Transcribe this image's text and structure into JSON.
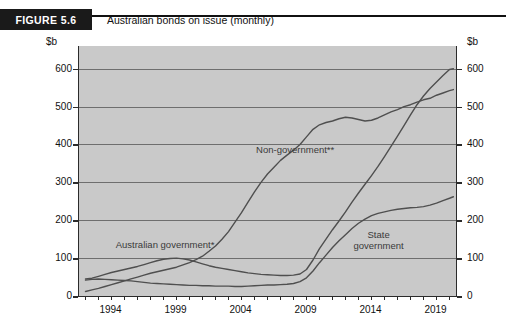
{
  "figure": {
    "tag": "FIGURE 5.6",
    "title": "Australian bonds on issue (monthly)"
  },
  "chart_data": {
    "type": "line",
    "title": "Australian bonds on issue (monthly)",
    "xlabel": "",
    "ylabel": "$b",
    "unit_label_left": "$b",
    "unit_label_right": "$b",
    "xlim": [
      1991.5,
      2020.5
    ],
    "ylim": [
      0,
      660
    ],
    "yticks": [
      0,
      100,
      200,
      300,
      400,
      500,
      600
    ],
    "xticks": [
      1994,
      1999,
      2004,
      2009,
      2014,
      2019
    ],
    "xtick_minor_step": 1,
    "grid": "horizontal",
    "legend": "inline-annotations",
    "annotations": [
      {
        "text": "Non-government**",
        "x": 2005.2,
        "y": 400
      },
      {
        "text": "Australian government*",
        "x": 1994.4,
        "y": 150
      },
      {
        "text": "State government",
        "x": 2015.0,
        "y": 160
      }
    ],
    "series": [
      {
        "name": "Australian government*",
        "label": "Australian government*",
        "color": "#4f4f4f",
        "points": [
          [
            1992.0,
            45
          ],
          [
            1992.5,
            47
          ],
          [
            1993.0,
            52
          ],
          [
            1993.5,
            57
          ],
          [
            1994.0,
            62
          ],
          [
            1994.5,
            66
          ],
          [
            1995.0,
            70
          ],
          [
            1995.5,
            74
          ],
          [
            1996.0,
            78
          ],
          [
            1996.5,
            83
          ],
          [
            1997.0,
            88
          ],
          [
            1997.5,
            93
          ],
          [
            1998.0,
            97
          ],
          [
            1998.5,
            99
          ],
          [
            1999.0,
            100
          ],
          [
            1999.5,
            98
          ],
          [
            2000.0,
            95
          ],
          [
            2000.5,
            90
          ],
          [
            2001.0,
            85
          ],
          [
            2001.5,
            80
          ],
          [
            2002.0,
            76
          ],
          [
            2002.5,
            73
          ],
          [
            2003.0,
            70
          ],
          [
            2003.5,
            67
          ],
          [
            2004.0,
            64
          ],
          [
            2004.5,
            61
          ],
          [
            2005.0,
            59
          ],
          [
            2005.5,
            57
          ],
          [
            2006.0,
            56
          ],
          [
            2006.5,
            55
          ],
          [
            2007.0,
            54
          ],
          [
            2007.5,
            54
          ],
          [
            2008.0,
            55
          ],
          [
            2008.5,
            58
          ],
          [
            2009.0,
            70
          ],
          [
            2009.5,
            95
          ],
          [
            2010.0,
            125
          ],
          [
            2010.5,
            150
          ],
          [
            2011.0,
            175
          ],
          [
            2011.5,
            198
          ],
          [
            2012.0,
            222
          ],
          [
            2012.5,
            248
          ],
          [
            2013.0,
            272
          ],
          [
            2013.5,
            295
          ],
          [
            2014.0,
            318
          ],
          [
            2014.5,
            342
          ],
          [
            2015.0,
            368
          ],
          [
            2015.5,
            395
          ],
          [
            2016.0,
            422
          ],
          [
            2016.5,
            450
          ],
          [
            2017.0,
            478
          ],
          [
            2017.5,
            505
          ],
          [
            2018.0,
            528
          ],
          [
            2018.5,
            548
          ],
          [
            2019.0,
            565
          ],
          [
            2019.5,
            582
          ],
          [
            2020.0,
            598
          ],
          [
            2020.3,
            600
          ]
        ],
        "end_value": 600
      },
      {
        "name": "Non-government**",
        "label": "Non-government**",
        "color": "#4f4f4f",
        "points": [
          [
            1992.0,
            12
          ],
          [
            1992.5,
            16
          ],
          [
            1993.0,
            20
          ],
          [
            1993.5,
            25
          ],
          [
            1994.0,
            30
          ],
          [
            1994.5,
            35
          ],
          [
            1995.0,
            40
          ],
          [
            1995.5,
            45
          ],
          [
            1996.0,
            50
          ],
          [
            1996.5,
            55
          ],
          [
            1997.0,
            60
          ],
          [
            1997.5,
            64
          ],
          [
            1998.0,
            68
          ],
          [
            1998.5,
            72
          ],
          [
            1999.0,
            76
          ],
          [
            1999.5,
            82
          ],
          [
            2000.0,
            88
          ],
          [
            2000.5,
            96
          ],
          [
            2001.0,
            105
          ],
          [
            2001.5,
            118
          ],
          [
            2002.0,
            132
          ],
          [
            2002.5,
            150
          ],
          [
            2003.0,
            170
          ],
          [
            2003.5,
            195
          ],
          [
            2004.0,
            220
          ],
          [
            2004.5,
            248
          ],
          [
            2005.0,
            275
          ],
          [
            2005.5,
            300
          ],
          [
            2006.0,
            322
          ],
          [
            2006.5,
            340
          ],
          [
            2007.0,
            358
          ],
          [
            2007.5,
            372
          ],
          [
            2008.0,
            385
          ],
          [
            2008.5,
            400
          ],
          [
            2009.0,
            420
          ],
          [
            2009.5,
            440
          ],
          [
            2010.0,
            452
          ],
          [
            2010.5,
            458
          ],
          [
            2011.0,
            462
          ],
          [
            2011.5,
            468
          ],
          [
            2012.0,
            472
          ],
          [
            2012.5,
            470
          ],
          [
            2013.0,
            466
          ],
          [
            2013.5,
            462
          ],
          [
            2014.0,
            464
          ],
          [
            2014.5,
            470
          ],
          [
            2015.0,
            478
          ],
          [
            2015.5,
            486
          ],
          [
            2016.0,
            492
          ],
          [
            2016.5,
            500
          ],
          [
            2017.0,
            505
          ],
          [
            2017.5,
            512
          ],
          [
            2018.0,
            518
          ],
          [
            2018.5,
            522
          ],
          [
            2019.0,
            530
          ],
          [
            2019.5,
            536
          ],
          [
            2020.0,
            542
          ],
          [
            2020.3,
            545
          ]
        ],
        "end_value": 545
      },
      {
        "name": "State government",
        "label": "State government",
        "color": "#4f4f4f",
        "points": [
          [
            1992.0,
            42
          ],
          [
            1992.5,
            44
          ],
          [
            1993.0,
            45
          ],
          [
            1993.5,
            44
          ],
          [
            1994.0,
            43
          ],
          [
            1994.5,
            42
          ],
          [
            1995.0,
            41
          ],
          [
            1995.5,
            40
          ],
          [
            1996.0,
            38
          ],
          [
            1996.5,
            36
          ],
          [
            1997.0,
            34
          ],
          [
            1997.5,
            33
          ],
          [
            1998.0,
            32
          ],
          [
            1998.5,
            31
          ],
          [
            1999.0,
            30
          ],
          [
            1999.5,
            29
          ],
          [
            2000.0,
            28
          ],
          [
            2000.5,
            28
          ],
          [
            2001.0,
            27
          ],
          [
            2001.5,
            27
          ],
          [
            2002.0,
            26
          ],
          [
            2002.5,
            26
          ],
          [
            2003.0,
            26
          ],
          [
            2003.5,
            25
          ],
          [
            2004.0,
            25
          ],
          [
            2004.5,
            26
          ],
          [
            2005.0,
            27
          ],
          [
            2005.5,
            28
          ],
          [
            2006.0,
            29
          ],
          [
            2006.5,
            29
          ],
          [
            2007.0,
            30
          ],
          [
            2007.5,
            31
          ],
          [
            2008.0,
            33
          ],
          [
            2008.5,
            38
          ],
          [
            2009.0,
            48
          ],
          [
            2009.5,
            66
          ],
          [
            2010.0,
            88
          ],
          [
            2010.5,
            108
          ],
          [
            2011.0,
            128
          ],
          [
            2011.5,
            146
          ],
          [
            2012.0,
            162
          ],
          [
            2012.5,
            178
          ],
          [
            2013.0,
            192
          ],
          [
            2013.5,
            203
          ],
          [
            2014.0,
            212
          ],
          [
            2014.5,
            218
          ],
          [
            2015.0,
            222
          ],
          [
            2015.5,
            226
          ],
          [
            2016.0,
            229
          ],
          [
            2016.5,
            231
          ],
          [
            2017.0,
            233
          ],
          [
            2017.5,
            234
          ],
          [
            2018.0,
            236
          ],
          [
            2018.5,
            240
          ],
          [
            2019.0,
            245
          ],
          [
            2019.5,
            252
          ],
          [
            2020.0,
            258
          ],
          [
            2020.3,
            262
          ]
        ],
        "end_value": 262
      }
    ]
  }
}
